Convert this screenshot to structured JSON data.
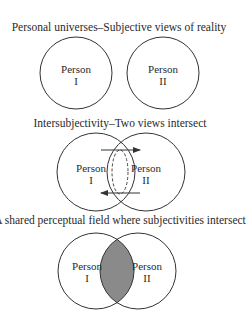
{
  "panels": [
    {
      "title": "Personal universes–Subjective views of reality",
      "left": {
        "name": "Person",
        "numeral": "I"
      },
      "right": {
        "name": "Person",
        "numeral": "II"
      }
    },
    {
      "title": "Intersubjectivity–Two views intersect",
      "left": {
        "name": "Person",
        "numeral": "I"
      },
      "right": {
        "name": "Person",
        "numeral": "II"
      }
    },
    {
      "title": "A shared perceptual field where subjectivities intersect",
      "left": {
        "name": "Person",
        "numeral": "I"
      },
      "right": {
        "name": "Person",
        "numeral": "II"
      }
    }
  ],
  "colors": {
    "stroke": "#333333",
    "overlap_fill": "#8a8a8a",
    "background": "#ffffff"
  }
}
